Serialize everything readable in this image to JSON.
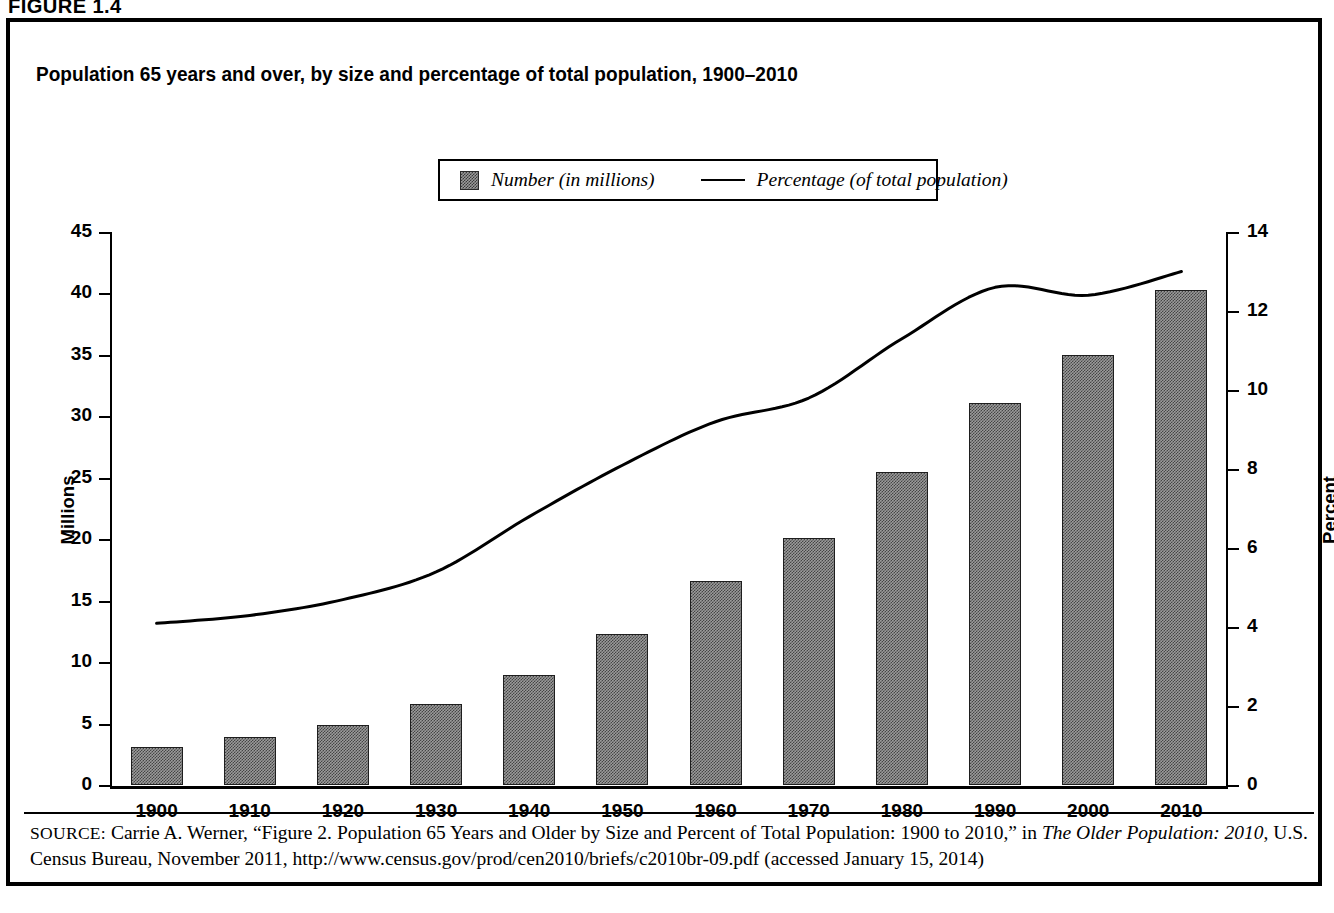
{
  "figure": {
    "label": "FIGURE 1.4",
    "title": "Population 65 years and over, by size and percentage of total population, 1900–2010"
  },
  "legend": {
    "position": "top-center",
    "items": [
      {
        "label": "Number (in millions)",
        "marker": "hatched-square-swatch"
      },
      {
        "label": "Percentage (of total population)",
        "marker": "solid-line"
      }
    ]
  },
  "axes": {
    "left": {
      "title": "Millions",
      "ticks": [
        "0",
        "5",
        "10",
        "15",
        "20",
        "25",
        "30",
        "35",
        "40",
        "45"
      ],
      "min": 0,
      "max": 45
    },
    "right": {
      "title": "Percent",
      "ticks": [
        "0",
        "2",
        "4",
        "6",
        "8",
        "10",
        "12",
        "14"
      ],
      "min": 0,
      "max": 14
    },
    "x": {
      "ticks": [
        "1900",
        "1910",
        "1920",
        "1930",
        "1940",
        "1950",
        "1960",
        "1970",
        "1980",
        "1990",
        "2000",
        "2010"
      ]
    }
  },
  "source": {
    "prefix": "SOURCE:",
    "text_before_italic": " Carrie A. Werner, “Figure 2. Population 65 Years and Older by Size and Percent of Total Population: 1900 to 2010,” in ",
    "italic_title": "The Older Population: 2010",
    "text_after_italic": ", U.S. Census Bureau, November 2011, http://www.census.gov/prod/cen2010/briefs/c2010br-09.pdf (accessed January 15, 2014)"
  },
  "colors": {
    "bar_fill": "#9b9b9b",
    "bar_border": "#1e1e1e",
    "line": "#000000",
    "frame": "#000000",
    "background": "#ffffff"
  },
  "chart_data": {
    "type": "bar",
    "title": "Population 65 years and over, by size and percentage of total population, 1900–2010",
    "xlabel": "",
    "ylabel": "Millions",
    "y2label": "Percent",
    "ylim": [
      0,
      45
    ],
    "y2lim": [
      0,
      14
    ],
    "grid": false,
    "legend_position": "top-center",
    "categories": [
      "1900",
      "1910",
      "1920",
      "1930",
      "1940",
      "1950",
      "1960",
      "1970",
      "1980",
      "1990",
      "2000",
      "2010"
    ],
    "series": [
      {
        "name": "Number (in millions)",
        "type": "bar",
        "axis": "left",
        "values": [
          3.1,
          3.9,
          4.9,
          6.6,
          9.0,
          12.3,
          16.6,
          20.1,
          25.5,
          31.1,
          35.0,
          40.3
        ]
      },
      {
        "name": "Percentage (of total population)",
        "type": "line",
        "axis": "right",
        "values": [
          4.1,
          4.3,
          4.7,
          5.4,
          6.8,
          8.1,
          9.2,
          9.8,
          11.3,
          12.6,
          12.4,
          13.0
        ]
      }
    ]
  }
}
